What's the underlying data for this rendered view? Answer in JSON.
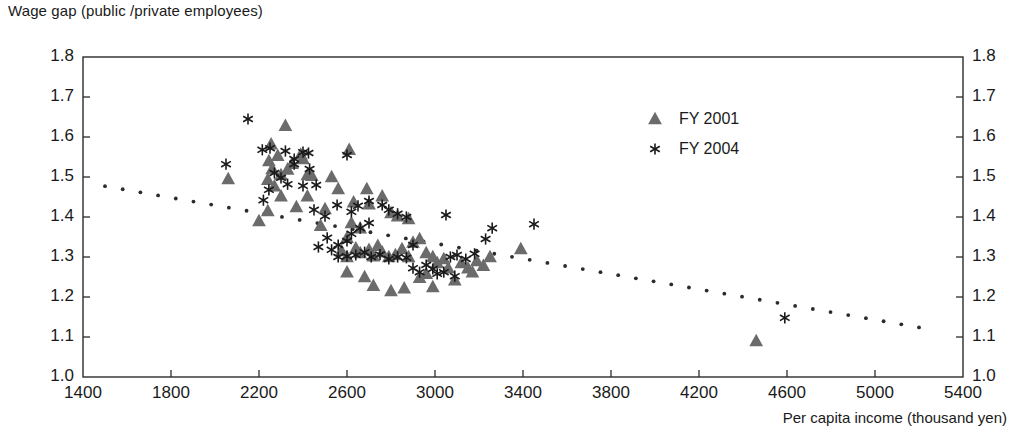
{
  "chart_data": {
    "type": "scatter",
    "title": "",
    "ylabel": "Wage gap (public /private employees)",
    "xlabel": "Per capita income (thousand yen)",
    "xlim": [
      1400,
      5400
    ],
    "ylim": [
      1.0,
      1.8
    ],
    "xticks": [
      1400,
      1800,
      2200,
      2600,
      3000,
      3400,
      3800,
      4200,
      4600,
      5000,
      5400
    ],
    "yticks": [
      1.0,
      1.1,
      1.2,
      1.3,
      1.4,
      1.5,
      1.6,
      1.7,
      1.8
    ],
    "xtick_labels": [
      "1400",
      "1800",
      "2200",
      "2600",
      "3000",
      "3400",
      "3800",
      "4200",
      "4600",
      "5000",
      "5400"
    ],
    "ytick_labels": [
      "1.0",
      "1.1",
      "1.2",
      "1.3",
      "1.4",
      "1.5",
      "1.6",
      "1.7",
      "1.8"
    ],
    "grid": false,
    "right_axis_mirror": true,
    "legend_position": "upper-right-inside",
    "marker_color": "#6b6b6b",
    "trendline_color": "#2b2b2b",
    "series": [
      {
        "name": "FY 2001",
        "marker": "triangle",
        "color": "#6b6b6b",
        "points": [
          [
            2060,
            1.495
          ],
          [
            2255,
            1.582
          ],
          [
            2245,
            1.54
          ],
          [
            2320,
            1.628
          ],
          [
            2260,
            1.52
          ],
          [
            2285,
            1.553
          ],
          [
            2390,
            1.556
          ],
          [
            2400,
            1.545
          ],
          [
            2350,
            1.533
          ],
          [
            2330,
            1.519
          ],
          [
            2300,
            1.505
          ],
          [
            2240,
            1.493
          ],
          [
            2270,
            1.477
          ],
          [
            2420,
            1.505
          ],
          [
            2440,
            1.503
          ],
          [
            2530,
            1.5
          ],
          [
            2610,
            1.568
          ],
          [
            2560,
            1.47
          ],
          [
            2420,
            1.452
          ],
          [
            2300,
            1.452
          ],
          [
            2370,
            1.425
          ],
          [
            2240,
            1.415
          ],
          [
            2200,
            1.39
          ],
          [
            2630,
            1.437
          ],
          [
            2690,
            1.47
          ],
          [
            2700,
            1.432
          ],
          [
            2760,
            1.452
          ],
          [
            2800,
            1.41
          ],
          [
            2830,
            1.402
          ],
          [
            2880,
            1.395
          ],
          [
            2620,
            1.385
          ],
          [
            2660,
            1.372
          ],
          [
            2600,
            1.348
          ],
          [
            2575,
            1.315
          ],
          [
            2600,
            1.3
          ],
          [
            2640,
            1.322
          ],
          [
            2660,
            1.31
          ],
          [
            2700,
            1.318
          ],
          [
            2720,
            1.302
          ],
          [
            2740,
            1.328
          ],
          [
            2760,
            1.312
          ],
          [
            2790,
            1.3
          ],
          [
            2820,
            1.305
          ],
          [
            2850,
            1.32
          ],
          [
            2880,
            1.3
          ],
          [
            2900,
            1.336
          ],
          [
            2930,
            1.345
          ],
          [
            2960,
            1.31
          ],
          [
            2990,
            1.3
          ],
          [
            3010,
            1.285
          ],
          [
            3040,
            1.295
          ],
          [
            3060,
            1.272
          ],
          [
            3090,
            1.242
          ],
          [
            3120,
            1.285
          ],
          [
            3150,
            1.272
          ],
          [
            3190,
            1.29
          ],
          [
            3220,
            1.278
          ],
          [
            3250,
            1.3
          ],
          [
            2600,
            1.262
          ],
          [
            2680,
            1.25
          ],
          [
            2720,
            1.228
          ],
          [
            2800,
            1.215
          ],
          [
            2860,
            1.222
          ],
          [
            2930,
            1.248
          ],
          [
            2990,
            1.225
          ],
          [
            3390,
            1.32
          ],
          [
            4460,
            1.09
          ],
          [
            2500,
            1.42
          ],
          [
            2480,
            1.378
          ],
          [
            3170,
            1.262
          ],
          [
            2960,
            1.258
          ]
        ]
      },
      {
        "name": "FY 2004",
        "marker": "star",
        "color": "#1a1a1a",
        "points": [
          [
            2150,
            1.645
          ],
          [
            2050,
            1.532
          ],
          [
            2215,
            1.568
          ],
          [
            2250,
            1.572
          ],
          [
            2320,
            1.565
          ],
          [
            2360,
            1.545
          ],
          [
            2400,
            1.562
          ],
          [
            2425,
            1.56
          ],
          [
            2600,
            1.555
          ],
          [
            2270,
            1.51
          ],
          [
            2300,
            1.498
          ],
          [
            2360,
            1.532
          ],
          [
            2430,
            1.52
          ],
          [
            2245,
            1.468
          ],
          [
            2220,
            1.442
          ],
          [
            2330,
            1.482
          ],
          [
            2400,
            1.478
          ],
          [
            2460,
            1.48
          ],
          [
            2555,
            1.43
          ],
          [
            2450,
            1.418
          ],
          [
            2500,
            1.402
          ],
          [
            2620,
            1.413
          ],
          [
            2650,
            1.428
          ],
          [
            2700,
            1.44
          ],
          [
            2760,
            1.43
          ],
          [
            2790,
            1.418
          ],
          [
            2830,
            1.408
          ],
          [
            2870,
            1.4
          ],
          [
            2700,
            1.385
          ],
          [
            2660,
            1.372
          ],
          [
            2620,
            1.358
          ],
          [
            2600,
            1.34
          ],
          [
            2560,
            1.33
          ],
          [
            2530,
            1.318
          ],
          [
            2560,
            1.3
          ],
          [
            2600,
            1.302
          ],
          [
            2640,
            1.305
          ],
          [
            2680,
            1.312
          ],
          [
            2710,
            1.3
          ],
          [
            2750,
            1.306
          ],
          [
            2790,
            1.295
          ],
          [
            2830,
            1.3
          ],
          [
            2870,
            1.298
          ],
          [
            2900,
            1.272
          ],
          [
            2930,
            1.262
          ],
          [
            2960,
            1.28
          ],
          [
            2990,
            1.27
          ],
          [
            3010,
            1.258
          ],
          [
            3040,
            1.262
          ],
          [
            3070,
            1.3
          ],
          [
            3100,
            1.305
          ],
          [
            3140,
            1.295
          ],
          [
            3180,
            1.308
          ],
          [
            3230,
            1.345
          ],
          [
            3260,
            1.372
          ],
          [
            3050,
            1.405
          ],
          [
            3450,
            1.382
          ],
          [
            4590,
            1.148
          ],
          [
            2470,
            1.325
          ],
          [
            2510,
            1.348
          ],
          [
            2900,
            1.33
          ],
          [
            3090,
            1.252
          ]
        ]
      }
    ],
    "trendline": {
      "style": "dotted",
      "x_start": 1500,
      "y_start": 1.477,
      "x_end": 5200,
      "y_end": 1.124
    }
  },
  "legend": {
    "items": [
      {
        "label": "FY 2001",
        "marker": "triangle"
      },
      {
        "label": "FY 2004",
        "marker": "star"
      }
    ]
  }
}
